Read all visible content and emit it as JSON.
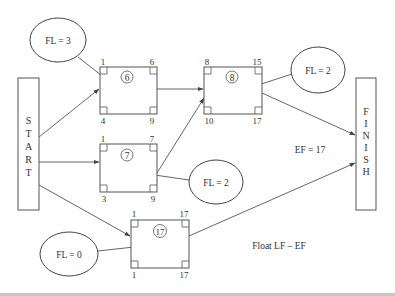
{
  "diagram": {
    "start_label": [
      "S",
      "T",
      "A",
      "R",
      "T"
    ],
    "finish_label": [
      "F",
      "I",
      "N",
      "I",
      "S",
      "H"
    ],
    "activities": [
      {
        "id": "6",
        "es": "1",
        "ef": "6",
        "ls": "4",
        "lf": "9"
      },
      {
        "id": "8",
        "es": "8",
        "ef": "15",
        "ls": "10",
        "lf": "17"
      },
      {
        "id": "7",
        "es": "1",
        "ef": "7",
        "ls": "3",
        "lf": "9"
      },
      {
        "id": "17",
        "es": "1",
        "ef": "17",
        "ls": "1",
        "lf": "17"
      }
    ],
    "floats": [
      {
        "label": "FL = 3",
        "target": "6"
      },
      {
        "label": "FL = 2",
        "target": "8"
      },
      {
        "label": "FL = 2",
        "target": "7"
      },
      {
        "label": "FL = 0",
        "target": "17"
      }
    ],
    "ef_label": "EF = 17",
    "formula_label": "Float LF – EF"
  }
}
